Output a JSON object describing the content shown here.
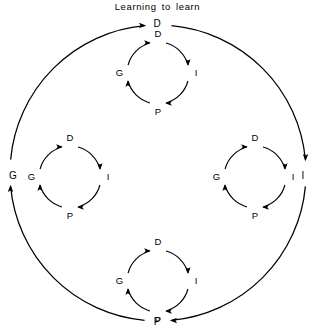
{
  "figure": {
    "title": "Learning to learn",
    "type": "recursive-cycle-diagram",
    "stroke_color": "#000000",
    "background_color": "#ffffff",
    "cycle_direction": "clockwise",
    "cycle_sequence": [
      "D",
      "I",
      "P",
      "G"
    ]
  },
  "outer_cycle": {
    "name": "outer-cycle",
    "nodes": [
      {
        "id": "outer-d",
        "label": "D",
        "position": "top",
        "cx": 157,
        "cy": 24,
        "arrow_direction": "right"
      },
      {
        "id": "outer-i",
        "label": "I",
        "position": "right",
        "cx": 303,
        "cy": 176,
        "arrow_direction": "down"
      },
      {
        "id": "outer-p",
        "label": "P",
        "position": "bottom",
        "cx": 157,
        "cy": 322,
        "arrow_direction": "left"
      },
      {
        "id": "outer-g",
        "label": "G",
        "position": "left",
        "cx": 13,
        "cy": 176,
        "arrow_direction": "up"
      }
    ],
    "center": {
      "x": 158,
      "y": 173
    },
    "radius": 148
  },
  "inner_cycles": [
    {
      "id": "inner-cycle-top",
      "name": "top-cycle",
      "center": {
        "x": 158,
        "y": 73
      },
      "radius": 31,
      "nodes": [
        {
          "id": "top-d",
          "label": "D",
          "position": "top",
          "arrow_direction": "right"
        },
        {
          "id": "top-i",
          "label": "I",
          "position": "right",
          "arrow_direction": "down"
        },
        {
          "id": "top-p",
          "label": "P",
          "position": "bottom",
          "arrow_direction": "left"
        },
        {
          "id": "top-g",
          "label": "G",
          "position": "left",
          "arrow_direction": "up"
        }
      ]
    },
    {
      "id": "inner-cycle-left",
      "name": "left-cycle",
      "center": {
        "x": 70,
        "y": 177
      },
      "radius": 31,
      "nodes": [
        {
          "id": "left-d",
          "label": "D",
          "position": "top",
          "arrow_direction": "right"
        },
        {
          "id": "left-i",
          "label": "I",
          "position": "right",
          "arrow_direction": "down"
        },
        {
          "id": "left-p",
          "label": "P",
          "position": "bottom",
          "arrow_direction": "left"
        },
        {
          "id": "left-g",
          "label": "G",
          "position": "left",
          "arrow_direction": "up"
        }
      ]
    },
    {
      "id": "inner-cycle-right",
      "name": "right-cycle",
      "center": {
        "x": 255,
        "y": 177
      },
      "radius": 31,
      "nodes": [
        {
          "id": "right-d",
          "label": "D",
          "position": "top",
          "arrow_direction": "right"
        },
        {
          "id": "right-i",
          "label": "I",
          "position": "right",
          "arrow_direction": "down"
        },
        {
          "id": "right-p",
          "label": "P",
          "position": "bottom",
          "arrow_direction": "left"
        },
        {
          "id": "right-g",
          "label": "G",
          "position": "left",
          "arrow_direction": "up"
        }
      ]
    },
    {
      "id": "inner-cycle-bottom",
      "name": "bottom-cycle",
      "center": {
        "x": 158,
        "y": 281
      },
      "radius": 31,
      "nodes": [
        {
          "id": "bottom-d",
          "label": "D",
          "position": "top",
          "arrow_direction": "right"
        },
        {
          "id": "bottom-i",
          "label": "I",
          "position": "right",
          "arrow_direction": "down"
        },
        {
          "id": "bottom-p",
          "label": "P",
          "position": "bottom",
          "arrow_direction": "left"
        },
        {
          "id": "bottom-g",
          "label": "G",
          "position": "left",
          "arrow_direction": "up"
        }
      ]
    }
  ]
}
